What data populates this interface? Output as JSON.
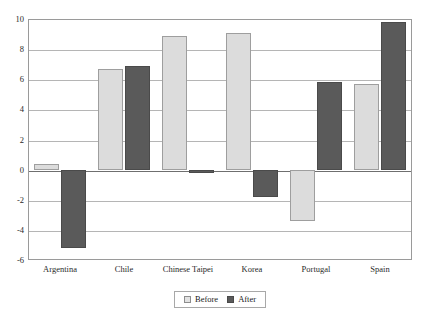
{
  "chart_data": {
    "type": "bar",
    "title": "",
    "xlabel": "",
    "ylabel": "",
    "ylim": [
      -6,
      10
    ],
    "yticks": [
      10,
      8,
      6,
      4,
      2,
      0,
      -2,
      -4,
      -6
    ],
    "grid": true,
    "legend_position": "bottom",
    "categories": [
      "Argentina",
      "Chile",
      "Chinese Taipei",
      "Korea",
      "Portugal",
      "Spain"
    ],
    "series": [
      {
        "name": "Before",
        "color": "#dcdcdc",
        "values": [
          0.35,
          6.7,
          8.9,
          9.1,
          -3.4,
          5.7
        ]
      },
      {
        "name": "After",
        "color": "#5a5a5a",
        "values": [
          -5.2,
          6.9,
          -0.2,
          -1.8,
          5.8,
          9.8
        ]
      }
    ]
  },
  "legend": {
    "items": [
      {
        "label": "Before",
        "swatch": "legend-swatch-before"
      },
      {
        "label": "After",
        "swatch": "legend-swatch-after"
      }
    ]
  }
}
